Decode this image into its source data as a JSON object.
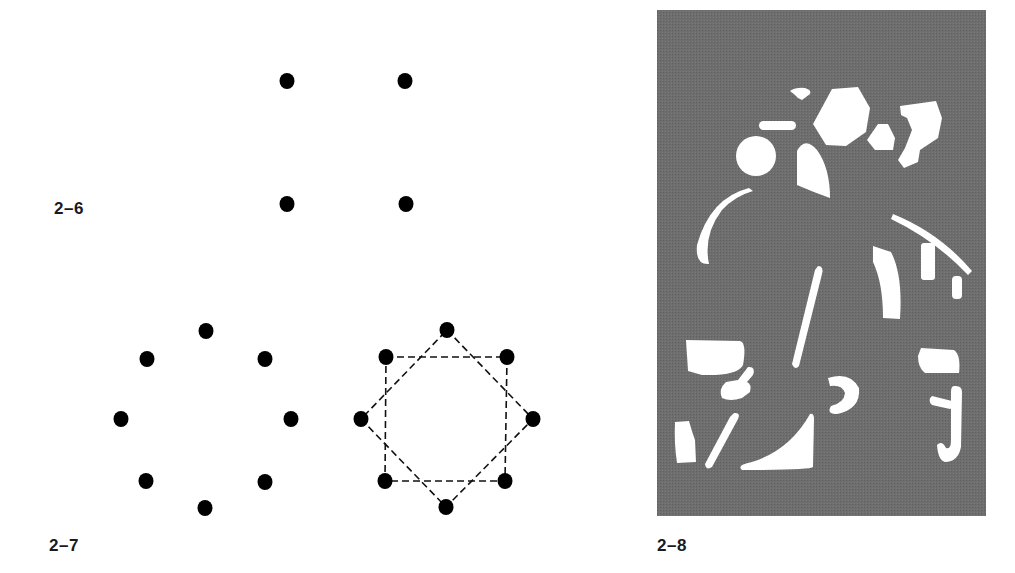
{
  "figures": [
    {
      "id": "2-6",
      "label": "2–6",
      "description": "Four dots arranged at the corners of a square",
      "dot_color": "#000000",
      "dots": [
        {
          "x": 287,
          "y": 81
        },
        {
          "x": 405,
          "y": 81
        },
        {
          "x": 287,
          "y": 204
        },
        {
          "x": 406,
          "y": 204
        }
      ]
    },
    {
      "id": "2-7",
      "label": "2–7",
      "description": "Eight dots arranged in a circle; on the right the same eight dots connected by dashed lines forming two overlapping squares (an eight-pointed star)",
      "left_dots": [
        {
          "x": 206,
          "y": 331
        },
        {
          "x": 147,
          "y": 359
        },
        {
          "x": 265,
          "y": 359
        },
        {
          "x": 121,
          "y": 419
        },
        {
          "x": 291,
          "y": 419
        },
        {
          "x": 146,
          "y": 481
        },
        {
          "x": 265,
          "y": 482
        },
        {
          "x": 205,
          "y": 508
        }
      ],
      "right_dots": [
        {
          "x": 447,
          "y": 330
        },
        {
          "x": 386,
          "y": 357
        },
        {
          "x": 507,
          "y": 357
        },
        {
          "x": 361,
          "y": 419
        },
        {
          "x": 533,
          "y": 419
        },
        {
          "x": 385,
          "y": 481
        },
        {
          "x": 505,
          "y": 481
        },
        {
          "x": 446,
          "y": 507
        }
      ],
      "square_upright": [
        [
          386,
          357
        ],
        [
          507,
          357
        ],
        [
          505,
          481
        ],
        [
          385,
          481
        ]
      ],
      "square_diamond": [
        [
          447,
          330
        ],
        [
          533,
          419
        ],
        [
          446,
          507
        ],
        [
          361,
          419
        ]
      ],
      "line_style": "dashed"
    },
    {
      "id": "2-8",
      "label": "2–8",
      "description": "Gray halftone panel with scattered white abstract fragments that together suggest a figure",
      "panel_color": "#6b6b6b",
      "fragment_color": "#ffffff",
      "panel": {
        "x": 657,
        "y": 10,
        "w": 329,
        "h": 506
      }
    }
  ]
}
